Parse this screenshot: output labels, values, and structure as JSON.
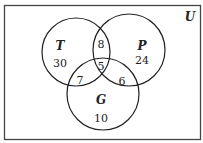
{
  "universe_label": "U",
  "sets": [
    {
      "name": "T",
      "only": "30"
    },
    {
      "name": "P",
      "only": "24"
    },
    {
      "name": "G",
      "only": "10"
    }
  ],
  "intersections": {
    "T_P_only": "8",
    "T_G_only": "7",
    "P_G_only": "6",
    "T_P_G": "5"
  }
}
